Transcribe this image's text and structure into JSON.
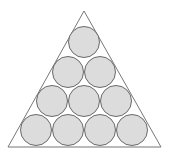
{
  "diagram": {
    "type": "circles-in-triangle",
    "triangle": {
      "points": [
        [
          84,
          11
        ],
        [
          8,
          147
        ],
        [
          161,
          147
        ]
      ],
      "stroke": "#777777",
      "fill": "#ffffff"
    },
    "circle_style": {
      "radius": 15.5,
      "fill": "#dcdcdc",
      "stroke": "#6a6a6a"
    },
    "rows": [
      {
        "y": 42,
        "xs": [
          84
        ]
      },
      {
        "y": 72,
        "xs": [
          68,
          100
        ]
      },
      {
        "y": 101,
        "xs": [
          52,
          84,
          116
        ]
      },
      {
        "y": 130,
        "xs": [
          36,
          68,
          100,
          132
        ]
      }
    ],
    "circle_count": 10
  }
}
